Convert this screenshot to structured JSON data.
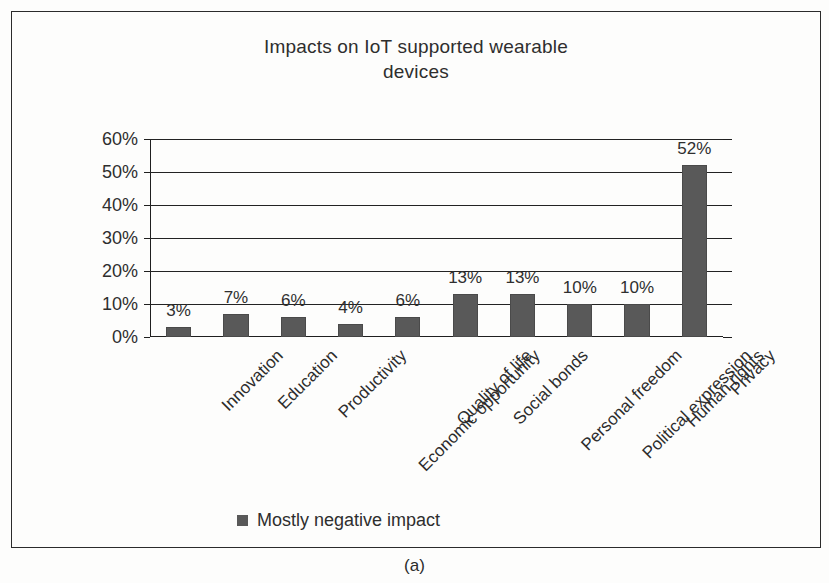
{
  "figure": {
    "caption": "(a)"
  },
  "chart_data": {
    "type": "bar",
    "title": "Impacts on IoT supported wearable devices",
    "title_lines": [
      "Impacts on IoT supported wearable",
      "devices"
    ],
    "xlabel": "",
    "ylabel": "",
    "ylim": [
      0,
      60
    ],
    "ytick_step": 10,
    "grid": true,
    "legend_position": "bottom",
    "bar_color": "#595959",
    "categories": [
      "Innovation",
      "Education",
      "Productivity",
      "Economic opportunity",
      "Quality of life",
      "Social bonds",
      "Personal freedom",
      "Political expression",
      "Human rights",
      "Privacy"
    ],
    "values": [
      3,
      7,
      6,
      4,
      6,
      13,
      13,
      10,
      10,
      52
    ],
    "data_labels": [
      "3%",
      "7%",
      "6%",
      "4%",
      "6%",
      "13%",
      "13%",
      "10%",
      "10%",
      "52%"
    ],
    "ytick_labels": [
      "0%",
      "10%",
      "20%",
      "30%",
      "40%",
      "50%",
      "60%"
    ],
    "series": [
      {
        "name": "Mostly negative impact",
        "values": [
          3,
          7,
          6,
          4,
          6,
          13,
          13,
          10,
          10,
          52
        ]
      }
    ],
    "legend": [
      {
        "label": "Mostly negative impact",
        "color": "#595959",
        "marker": "square"
      }
    ]
  }
}
